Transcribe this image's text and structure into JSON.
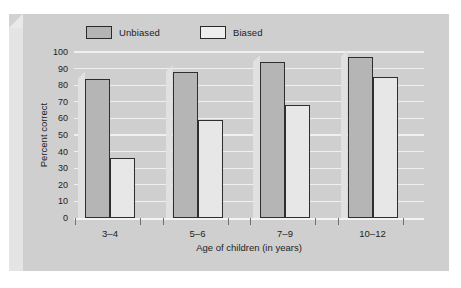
{
  "chart_data": {
    "type": "bar",
    "title": "",
    "subtitle": "",
    "xlabel": "Age of children (in years)",
    "ylabel": "Percent correct",
    "categories": [
      "3–4",
      "5–6",
      "7–9",
      "10–12"
    ],
    "series": [
      {
        "name": "Unbiased",
        "values": [
          84,
          88,
          94,
          97
        ],
        "color": "#b5b5b5"
      },
      {
        "name": "Biased",
        "values": [
          36,
          59,
          68,
          85
        ],
        "color": "#e7e7e7"
      }
    ],
    "ylim": [
      0,
      100
    ],
    "yticks": [
      0,
      10,
      20,
      30,
      40,
      50,
      60,
      70,
      80,
      90,
      100
    ],
    "ytick_labels": [
      "0",
      "10",
      "20",
      "30",
      "40",
      "50",
      "60",
      "70",
      "80",
      "90",
      "100"
    ],
    "grid": true,
    "grid_color": "#f0f0f0",
    "legend_position": "top-left",
    "background": "#cfcfcf",
    "frame_style": "3d-beveled-plate"
  },
  "legend": {
    "items": [
      {
        "label": "Unbiased",
        "swatch": "filled-gray-swatch"
      },
      {
        "label": "Biased",
        "swatch": "outline-white-swatch"
      }
    ]
  },
  "axes": {
    "y_title": "Percent correct",
    "x_title": "Age of children (in years)"
  }
}
